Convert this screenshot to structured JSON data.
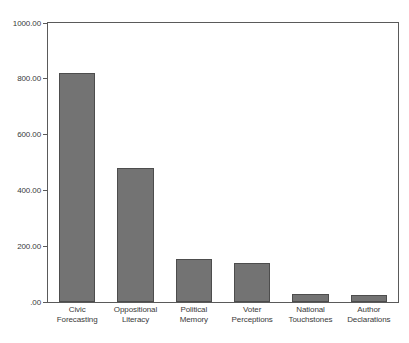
{
  "chart_data": {
    "type": "bar",
    "title": "",
    "subtitle": "",
    "xlabel": "",
    "ylabel": "",
    "ylim": [
      0,
      1000
    ],
    "grid": false,
    "legend": "none",
    "bar_color": "#737373",
    "bar_border_color": "#4d4d4d",
    "axis_color": "#5a5a5a",
    "background_color": "#ffffff",
    "y_ticks": [
      {
        "value": 1000,
        "label": "1000.00"
      },
      {
        "value": 800,
        "label": "800.00"
      },
      {
        "value": 600,
        "label": "600.00"
      },
      {
        "value": 400,
        "label": "400.00"
      },
      {
        "value": 200,
        "label": "200.00"
      },
      {
        "value": 0,
        "label": ".00"
      }
    ],
    "categories": [
      "Civic Forecasting",
      "Oppositional Literacy",
      "Political Memory",
      "Voter Perceptions",
      "National Touchstones",
      "Author Declarations"
    ],
    "category_lines": [
      [
        "Civic",
        "Forecasting"
      ],
      [
        "Oppositional",
        "Literacy"
      ],
      [
        "Political",
        "Memory"
      ],
      [
        "Voter",
        "Perceptions"
      ],
      [
        "National",
        "Touchstones"
      ],
      [
        "Author",
        "Declarations"
      ]
    ],
    "values": [
      820,
      480,
      155,
      140,
      27,
      25
    ]
  }
}
